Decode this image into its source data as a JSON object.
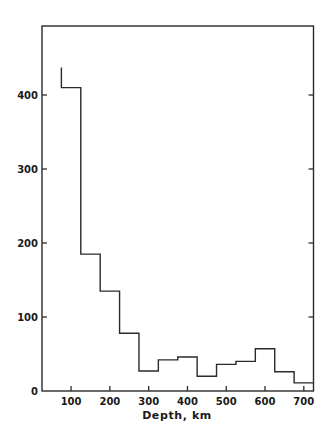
{
  "chart_data": {
    "type": "bar",
    "style": "step-histogram",
    "title": "",
    "xlabel": "Depth, km",
    "ylabel": "",
    "xlim": [
      25,
      725
    ],
    "ylim": [
      0,
      480
    ],
    "grid": false,
    "legend": null,
    "x_ticks": [
      100,
      200,
      300,
      400,
      500,
      600,
      700
    ],
    "y_ticks": [
      0,
      100,
      200,
      300,
      400
    ],
    "bin_edges": [
      75,
      125,
      175,
      225,
      275,
      325,
      375,
      425,
      475,
      525,
      575,
      625,
      675,
      725
    ],
    "categories": [
      "75-125",
      "125-175",
      "175-225",
      "225-275",
      "275-325",
      "325-375",
      "375-425",
      "425-475",
      "475-525",
      "525-575",
      "575-625",
      "625-675",
      "675-725"
    ],
    "values": [
      410,
      185,
      135,
      78,
      27,
      42,
      46,
      20,
      36,
      40,
      57,
      26,
      11
    ],
    "leading_edge_top": 437
  },
  "axes": {
    "x_tick_labels": [
      "100",
      "200",
      "300",
      "400",
      "500",
      "600",
      "700"
    ],
    "y_tick_labels": [
      "0",
      "100",
      "200",
      "300",
      "400"
    ],
    "x_title": "Depth, km"
  }
}
